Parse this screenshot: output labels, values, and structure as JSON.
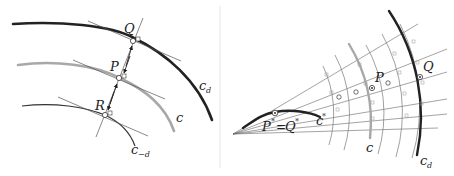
{
  "left_panel": {
    "curves": [
      {
        "id": "c_d",
        "label": "c",
        "subscript": "d",
        "color": "#222222",
        "width": 2.6
      },
      {
        "id": "c",
        "label": "c",
        "subscript": "",
        "color": "#a8a8a8",
        "width": 2.6
      },
      {
        "id": "c_-d",
        "label": "c",
        "subscript": "−d",
        "color": "#333333",
        "width": 1.2
      }
    ],
    "points": [
      {
        "label": "Q"
      },
      {
        "label": "P"
      },
      {
        "label": "R"
      }
    ]
  },
  "right_panel": {
    "curves": [
      {
        "id": "c_star",
        "label": "c",
        "superscript": "*",
        "color": "#222222"
      },
      {
        "id": "c",
        "label": "c",
        "color": "#a8a8a8"
      },
      {
        "id": "c_d",
        "label": "c",
        "subscript": "d",
        "color": "#222222"
      }
    ],
    "points": [
      {
        "label": "P"
      },
      {
        "label": "Q"
      },
      {
        "label": "P* = Q*",
        "left": "P",
        "left_sup": "*",
        "eq": "=",
        "right": "Q",
        "right_sup": "*"
      }
    ]
  },
  "colors": {
    "dark_curve": "#222222",
    "gray_curve": "#a8a8a8",
    "thin_line": "#555555",
    "light_arc": "#777777",
    "divider": "#e6e6e6"
  }
}
